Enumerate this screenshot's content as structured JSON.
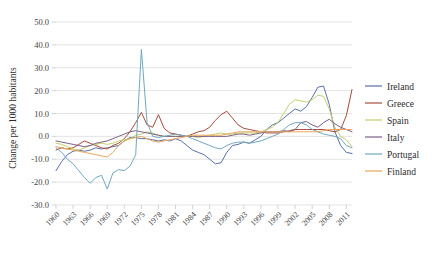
{
  "chart_data": {
    "type": "line",
    "title": "",
    "xlabel": "",
    "ylabel": "Change per 1000 habitants",
    "ylim": [
      -30,
      50
    ],
    "yticks": [
      "50.0",
      "40.0",
      "30.0",
      "20.0",
      "10.0",
      "0.0",
      "-10.0",
      "-20.0",
      "-30.0"
    ],
    "ytick_values": [
      50,
      40,
      30,
      20,
      10,
      0,
      -10,
      -20,
      -30
    ],
    "grid": "horizontal",
    "legend_position": "right",
    "xlim": [
      1960,
      2012
    ],
    "xticks": [
      "1960",
      "1963",
      "1966",
      "1969",
      "1972",
      "1975",
      "1978",
      "1981",
      "1984",
      "1987",
      "1990",
      "1993",
      "1996",
      "1999",
      "2002",
      "2005",
      "2008",
      "2011"
    ],
    "xtick_values": [
      1960,
      1963,
      1966,
      1969,
      1972,
      1975,
      1978,
      1981,
      1984,
      1987,
      1990,
      1993,
      1996,
      1999,
      2002,
      2005,
      2008,
      2011
    ],
    "x": [
      1960,
      1961,
      1962,
      1963,
      1964,
      1965,
      1966,
      1967,
      1968,
      1969,
      1970,
      1971,
      1972,
      1973,
      1974,
      1975,
      1976,
      1977,
      1978,
      1979,
      1980,
      1981,
      1982,
      1983,
      1984,
      1985,
      1986,
      1987,
      1988,
      1989,
      1990,
      1991,
      1992,
      1993,
      1994,
      1995,
      1996,
      1997,
      1998,
      1999,
      2000,
      2001,
      2002,
      2003,
      2004,
      2005,
      2006,
      2007,
      2008,
      2009,
      2010,
      2011,
      2012
    ],
    "series": [
      {
        "name": "Ireland",
        "color": "#5a6fa8",
        "values": [
          -15.0,
          -11.0,
          -8.0,
          -6.5,
          -6.0,
          -6.5,
          -6.0,
          -5.0,
          -5.5,
          -5.0,
          -4.5,
          -4.0,
          -2.0,
          -0.5,
          -0.5,
          -1.0,
          -1.0,
          -1.5,
          -2.0,
          -1.5,
          -2.0,
          -1.0,
          -2.0,
          -4.0,
          -6.0,
          -7.0,
          -8.0,
          -10.0,
          -12.0,
          -11.5,
          -7.0,
          -4.0,
          -3.5,
          -2.5,
          -3.0,
          -1.5,
          0.0,
          3.0,
          5.0,
          6.0,
          8.0,
          10.0,
          12.0,
          11.0,
          13.0,
          17.0,
          21.5,
          22.0,
          14.0,
          2.0,
          -4.0,
          -7.0,
          -7.5
        ]
      },
      {
        "name": "Greece",
        "color": "#a84b3c",
        "values": [
          -6.0,
          -5.0,
          -5.5,
          -5.0,
          -3.5,
          -2.0,
          -3.0,
          -4.0,
          -5.0,
          -5.5,
          -4.0,
          -3.0,
          -1.0,
          2.0,
          6.0,
          10.5,
          5.0,
          4.0,
          9.5,
          3.5,
          1.5,
          1.0,
          0.5,
          0.0,
          1.0,
          2.0,
          2.5,
          4.0,
          7.0,
          9.5,
          11.0,
          8.0,
          5.0,
          3.5,
          3.0,
          2.5,
          2.0,
          1.5,
          1.5,
          1.5,
          2.0,
          2.5,
          3.0,
          3.0,
          3.0,
          3.0,
          3.0,
          3.0,
          2.5,
          2.0,
          3.0,
          9.0,
          20.5
        ]
      },
      {
        "name": "Spain",
        "color": "#c3cf6a",
        "values": [
          -3.0,
          -3.5,
          -4.5,
          -5.5,
          -6.0,
          -5.0,
          -4.0,
          -3.5,
          -3.0,
          -3.5,
          -3.0,
          -2.0,
          -1.5,
          -1.0,
          0.5,
          1.0,
          2.0,
          1.5,
          0.5,
          0.0,
          0.0,
          0.0,
          0.0,
          0.0,
          0.0,
          -0.5,
          0.0,
          0.5,
          1.0,
          1.5,
          1.0,
          1.0,
          1.5,
          1.5,
          1.5,
          1.5,
          2.0,
          3.0,
          4.0,
          6.0,
          10.0,
          14.0,
          16.0,
          15.5,
          15.0,
          16.0,
          18.0,
          17.5,
          12.0,
          4.0,
          0.0,
          -1.5,
          -4.5
        ]
      },
      {
        "name": "Italy",
        "color": "#7b5e86",
        "values": [
          -2.0,
          -2.5,
          -3.0,
          -3.5,
          -4.0,
          -4.5,
          -4.0,
          -3.0,
          -2.5,
          -2.0,
          -1.0,
          0.0,
          1.0,
          2.0,
          2.5,
          2.0,
          1.5,
          1.0,
          0.5,
          0.0,
          0.0,
          0.0,
          0.0,
          0.0,
          0.0,
          0.0,
          0.0,
          0.0,
          0.0,
          0.0,
          0.0,
          0.5,
          1.0,
          1.0,
          0.5,
          1.0,
          1.5,
          2.0,
          2.0,
          2.0,
          2.5,
          2.0,
          3.0,
          6.0,
          6.5,
          5.0,
          4.0,
          6.0,
          7.5,
          5.5,
          4.0,
          3.0,
          2.0
        ]
      },
      {
        "name": "Portugal",
        "color": "#6fa8c0",
        "values": [
          -5.0,
          -7.0,
          -10.0,
          -12.0,
          -15.0,
          -18.0,
          -20.5,
          -18.0,
          -17.0,
          -23.0,
          -16.0,
          -14.5,
          -15.0,
          -13.0,
          -8.0,
          38.0,
          6.0,
          0.0,
          -0.5,
          0.0,
          0.5,
          1.0,
          0.5,
          0.0,
          -1.0,
          -2.0,
          -3.0,
          -4.0,
          -5.0,
          -5.5,
          -4.0,
          -3.0,
          -2.5,
          -2.5,
          -3.0,
          -2.5,
          -2.0,
          -1.0,
          0.0,
          1.0,
          3.0,
          5.0,
          6.0,
          6.0,
          5.0,
          3.0,
          2.0,
          1.0,
          0.5,
          0.0,
          -1.0,
          -4.0,
          -5.0
        ]
      },
      {
        "name": "Finland",
        "color": "#e8a75a",
        "values": [
          -4.5,
          -5.0,
          -5.5,
          -6.0,
          -6.5,
          -7.0,
          -7.5,
          -8.0,
          -8.5,
          -9.0,
          -7.0,
          -4.0,
          -2.0,
          -1.0,
          -0.5,
          0.0,
          -1.0,
          -2.0,
          -2.5,
          -2.0,
          -1.5,
          -1.0,
          -0.5,
          0.0,
          0.5,
          0.5,
          0.5,
          0.5,
          0.5,
          0.5,
          1.0,
          1.5,
          2.0,
          2.0,
          2.0,
          2.0,
          2.0,
          2.0,
          2.0,
          2.0,
          2.0,
          2.0,
          2.0,
          2.0,
          2.0,
          2.0,
          2.0,
          2.5,
          3.0,
          3.0,
          3.0,
          3.0,
          3.0
        ]
      }
    ]
  },
  "legend": {
    "items": [
      {
        "label": "Ireland"
      },
      {
        "label": "Greece"
      },
      {
        "label": "Spain"
      },
      {
        "label": "Italy"
      },
      {
        "label": "Portugal"
      },
      {
        "label": "Finland"
      }
    ]
  }
}
